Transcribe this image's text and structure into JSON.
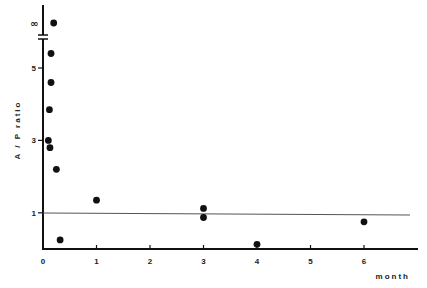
{
  "chart_data": {
    "type": "scatter",
    "title": "",
    "xlabel": "month",
    "ylabel": "A / P ratio",
    "xlim": [
      0,
      7
    ],
    "ylim": [
      0,
      6
    ],
    "x_ticks": [
      "0",
      "1",
      "2",
      "3",
      "4",
      "5",
      "6"
    ],
    "y_ticks": [
      "1",
      "3",
      "5"
    ],
    "y_break_label": "∞",
    "grid": false,
    "legend": null,
    "reference_line": {
      "y": 1,
      "label": "1"
    },
    "series": [
      {
        "name": "A/P ratio",
        "points": [
          {
            "x": 0.2,
            "y": "∞"
          },
          {
            "x": 0.15,
            "y": 5.4
          },
          {
            "x": 0.15,
            "y": 4.6
          },
          {
            "x": 0.12,
            "y": 3.85
          },
          {
            "x": 0.1,
            "y": 3.0
          },
          {
            "x": 0.13,
            "y": 2.8
          },
          {
            "x": 0.25,
            "y": 2.2
          },
          {
            "x": 0.32,
            "y": 0.25
          },
          {
            "x": 1.0,
            "y": 1.35
          },
          {
            "x": 3.0,
            "y": 1.12
          },
          {
            "x": 3.0,
            "y": 0.87
          },
          {
            "x": 4.0,
            "y": 0.13
          },
          {
            "x": 6.0,
            "y": 0.75
          }
        ]
      }
    ]
  },
  "colors": {
    "ink": "#111111",
    "line": "#555555",
    "background": "#ffffff"
  }
}
